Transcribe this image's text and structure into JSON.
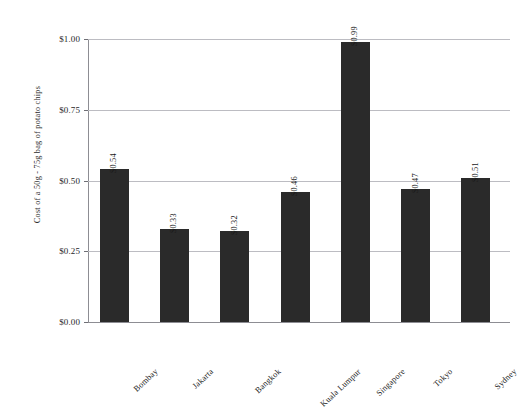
{
  "top_caption": "",
  "chart_data": {
    "type": "bar",
    "title": "",
    "xlabel": "",
    "ylabel": "Cost of a 50g - 75g bag of potato chips",
    "ylim": [
      0,
      1.0
    ],
    "ytick_labels": [
      "$1.00",
      "$0.75",
      "$0.50",
      "$0.25",
      "$0.00"
    ],
    "ytick_values": [
      1.0,
      0.75,
      0.5,
      0.25,
      0.0
    ],
    "grid": true,
    "legend": false,
    "categories": [
      "Bombay",
      "Jakarta",
      "Bangkok",
      "Kuala Lumpur",
      "Singapore",
      "Tokyo",
      "Sydney"
    ],
    "values": [
      0.54,
      0.33,
      0.32,
      0.46,
      0.99,
      0.47,
      0.51
    ],
    "value_labels": [
      "$0.54",
      "$0.33",
      "$0.32",
      "$0.46",
      "$0.99",
      "$0.47",
      "$0.51"
    ],
    "bar_color": "#2a2a2a",
    "grid_color": "#bcbcc2",
    "axis_color": "#8d8d93"
  }
}
